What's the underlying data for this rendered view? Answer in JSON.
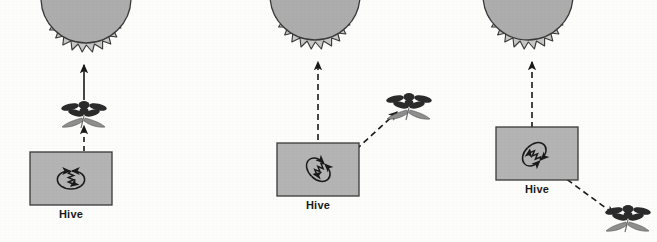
{
  "figure": {
    "background_color": "#fdfdfc",
    "ink_color": "#1a1a1a",
    "sun_corona_color": "#c8c8c8",
    "sun_disc_color": "#adadad",
    "hive_fill_color": "#b4b4b4",
    "flower_petal_color": "#2b2b2b",
    "flower_leaf_color": "#8f8f8f"
  },
  "panels": [
    {
      "id": "panel-food-toward-sun",
      "hive_label": "Hive",
      "sun": {
        "name": "sun",
        "cx": 85,
        "cy": -4,
        "radius": 56
      },
      "flower": {
        "name": "flower",
        "cx": 84,
        "cy": 113,
        "angle_deg": 0
      },
      "dance_angle_deg": 0,
      "arrow_flower_to_sun": {
        "style": "solid",
        "label": "bearing-to-sun"
      },
      "arrow_hive_to_flower": {
        "style": "dashed",
        "label": "bearing-to-food"
      },
      "hive_box": {
        "x": 30,
        "y": 152,
        "w": 82,
        "h": 53
      },
      "hive_label_x": 71,
      "hive_label_y": 208
    },
    {
      "id": "panel-food-45-right-of-sun",
      "hive_label": "Hive",
      "sun": {
        "name": "sun",
        "cx": 315,
        "cy": -6,
        "radius": 56
      },
      "flower": {
        "name": "flower",
        "cx": 408,
        "cy": 105,
        "angle_deg": 45
      },
      "dance_angle_deg": 45,
      "arrow_hive_to_sun": {
        "style": "dashed",
        "label": "bearing-to-sun"
      },
      "arrow_hive_to_flower": {
        "style": "dashed",
        "label": "bearing-to-food"
      },
      "hive_box": {
        "x": 277,
        "y": 143,
        "w": 82,
        "h": 53
      },
      "hive_label_x": 318,
      "hive_label_y": 199
    },
    {
      "id": "panel-food-135-right-of-sun",
      "hive_label": "Hive",
      "sun": {
        "name": "sun",
        "cx": 540,
        "cy": -6,
        "radius": 56
      },
      "flower": {
        "name": "flower",
        "cx": 626,
        "cy": 216,
        "angle_deg": 135
      },
      "dance_angle_deg": 135,
      "arrow_hive_to_sun": {
        "style": "dashed",
        "label": "bearing-to-sun"
      },
      "arrow_hive_to_flower": {
        "style": "dashed",
        "label": "bearing-to-food"
      },
      "hive_box": {
        "x": 496,
        "y": 127,
        "w": 82,
        "h": 53
      },
      "hive_label_x": 537,
      "hive_label_y": 183
    }
  ]
}
